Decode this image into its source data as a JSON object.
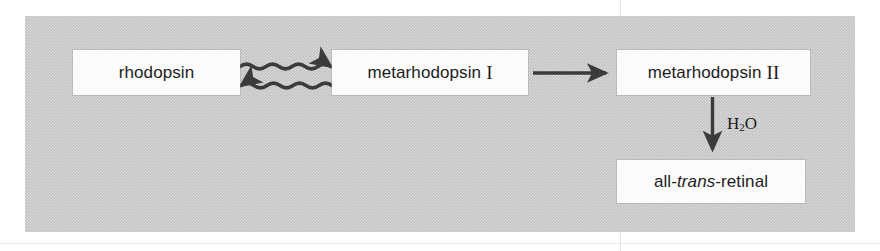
{
  "figure": {
    "panel_background_color": "#c3c3c3",
    "node_background_color": "#fbfbfb",
    "arrow_color": "#3b3b3b",
    "text_color": "#1d1d1d"
  },
  "nodes": {
    "rhodopsin": {
      "label": "rhodopsin"
    },
    "metarhodopsin_1": {
      "label": "metarhodopsin",
      "numeral": "I"
    },
    "metarhodopsin_2": {
      "label": "metarhodopsin",
      "numeral": "II"
    },
    "all_trans_retinal": {
      "prefix": "all-",
      "stereo": "trans",
      "suffix": "-retinal"
    }
  },
  "arrows": {
    "wavy_forward": {
      "name": "rhodopsin-to-metarhodopsin-I",
      "style": "wavy",
      "direction": "right"
    },
    "wavy_reverse": {
      "name": "metarhodopsin-I-to-rhodopsin",
      "style": "wavy",
      "direction": "left"
    },
    "straight_right": {
      "name": "metarhodopsin-I-to-metarhodopsin-II",
      "style": "straight",
      "direction": "right"
    },
    "straight_down": {
      "name": "metarhodopsin-II-to-all-trans-retinal",
      "style": "straight",
      "direction": "down",
      "label_prefix": "H",
      "label_sub": "2",
      "label_suffix": "O"
    }
  }
}
